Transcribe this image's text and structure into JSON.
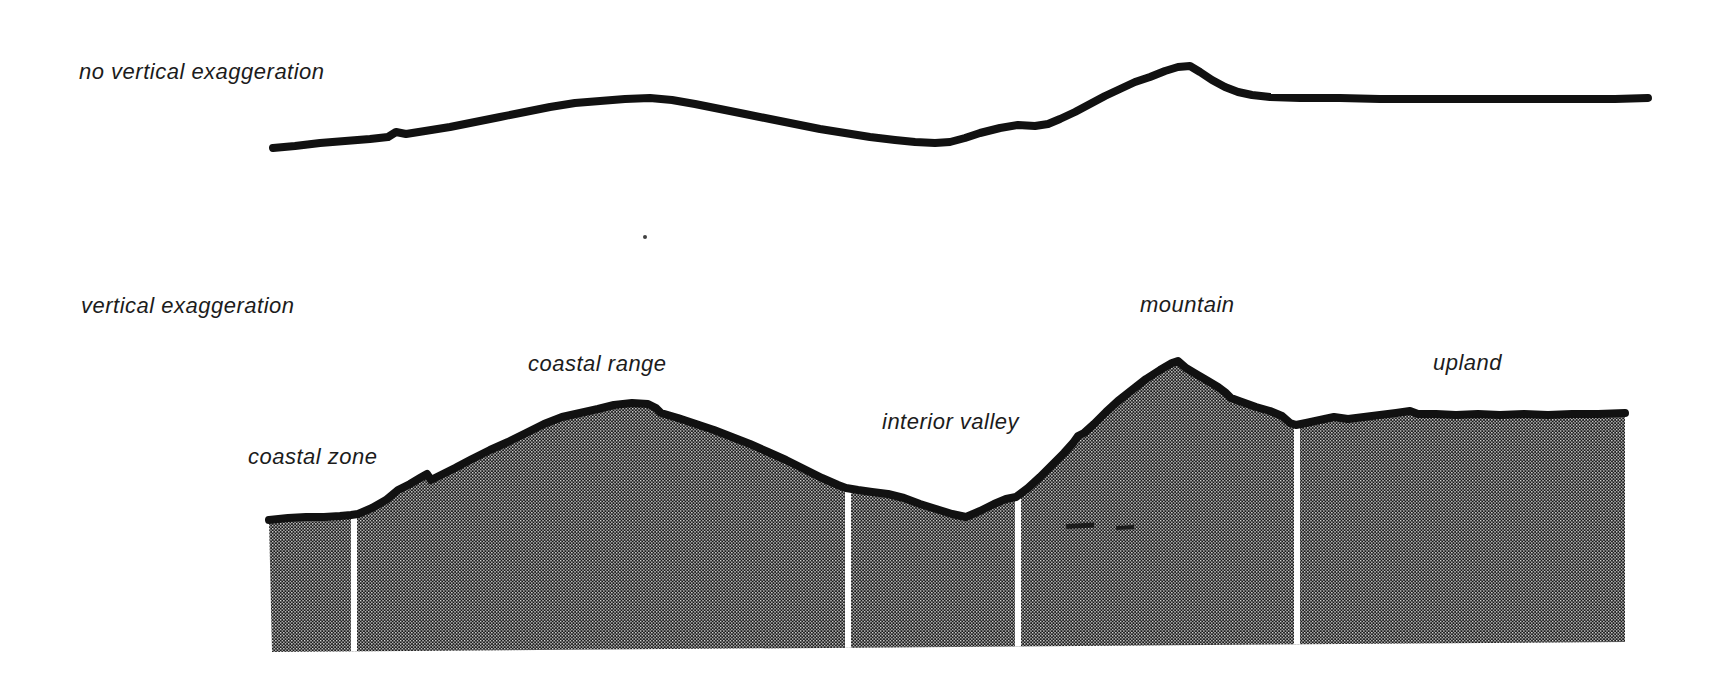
{
  "figure": {
    "width": 1717,
    "height": 695,
    "background": "#ffffff"
  },
  "labels": {
    "top_profile": {
      "text": "no vertical exaggeration",
      "x": 79,
      "y": 60
    },
    "bottom_profile": {
      "text": "vertical exaggeration",
      "x": 81,
      "y": 294
    },
    "zones": [
      {
        "text": "coastal zone",
        "x": 248,
        "y": 445
      },
      {
        "text": "coastal range",
        "x": 528,
        "y": 352
      },
      {
        "text": "interior valley",
        "x": 882,
        "y": 410
      },
      {
        "text": "mountain",
        "x": 1140,
        "y": 293
      },
      {
        "text": "upland",
        "x": 1433,
        "y": 351
      }
    ]
  },
  "style": {
    "ink": "#111111",
    "halftone_background": "#1a1a1a",
    "halftone_dot": "#e8e8e8",
    "divider_color": "#ffffff",
    "profile_line_width": 8,
    "surface_line_width": 8
  },
  "geometry": {
    "top_profile_points": [
      [
        273,
        148
      ],
      [
        295,
        146
      ],
      [
        320,
        143
      ],
      [
        345,
        141
      ],
      [
        370,
        139
      ],
      [
        388,
        137
      ],
      [
        396,
        132
      ],
      [
        406,
        134
      ],
      [
        425,
        131
      ],
      [
        450,
        127
      ],
      [
        475,
        122
      ],
      [
        500,
        117
      ],
      [
        525,
        112
      ],
      [
        550,
        107
      ],
      [
        575,
        103
      ],
      [
        600,
        101
      ],
      [
        625,
        99
      ],
      [
        650,
        98
      ],
      [
        672,
        100
      ],
      [
        695,
        104
      ],
      [
        720,
        109
      ],
      [
        745,
        114
      ],
      [
        770,
        119
      ],
      [
        795,
        124
      ],
      [
        820,
        129
      ],
      [
        845,
        133
      ],
      [
        870,
        137
      ],
      [
        895,
        140
      ],
      [
        915,
        142
      ],
      [
        935,
        143
      ],
      [
        950,
        142
      ],
      [
        965,
        138
      ],
      [
        980,
        133
      ],
      [
        1000,
        128
      ],
      [
        1018,
        125
      ],
      [
        1035,
        126
      ],
      [
        1048,
        124
      ],
      [
        1060,
        119
      ],
      [
        1075,
        112
      ],
      [
        1090,
        104
      ],
      [
        1105,
        96
      ],
      [
        1120,
        89
      ],
      [
        1135,
        82
      ],
      [
        1150,
        77
      ],
      [
        1165,
        71
      ],
      [
        1178,
        67
      ],
      [
        1190,
        66
      ],
      [
        1200,
        72
      ],
      [
        1212,
        80
      ],
      [
        1225,
        87
      ],
      [
        1238,
        92
      ],
      [
        1252,
        95
      ],
      [
        1270,
        97
      ],
      [
        1300,
        98
      ],
      [
        1340,
        98
      ],
      [
        1380,
        99
      ],
      [
        1420,
        99
      ],
      [
        1460,
        99
      ],
      [
        1500,
        99
      ],
      [
        1540,
        99
      ],
      [
        1580,
        99
      ],
      [
        1615,
        99
      ],
      [
        1648,
        98
      ]
    ],
    "terrain_surface_points": [
      [
        269,
        520
      ],
      [
        288,
        518
      ],
      [
        306,
        517
      ],
      [
        324,
        517
      ],
      [
        340,
        516
      ],
      [
        351,
        515
      ],
      [
        358,
        514
      ],
      [
        372,
        508
      ],
      [
        386,
        500
      ],
      [
        398,
        490
      ],
      [
        410,
        484
      ],
      [
        420,
        478
      ],
      [
        427,
        474
      ],
      [
        431,
        480
      ],
      [
        439,
        476
      ],
      [
        455,
        468
      ],
      [
        472,
        459
      ],
      [
        490,
        450
      ],
      [
        508,
        442
      ],
      [
        526,
        433
      ],
      [
        544,
        424
      ],
      [
        562,
        417
      ],
      [
        580,
        413
      ],
      [
        598,
        409
      ],
      [
        614,
        405
      ],
      [
        632,
        403
      ],
      [
        648,
        404
      ],
      [
        656,
        408
      ],
      [
        661,
        413
      ],
      [
        678,
        418
      ],
      [
        696,
        424
      ],
      [
        714,
        430
      ],
      [
        732,
        437
      ],
      [
        750,
        444
      ],
      [
        768,
        452
      ],
      [
        786,
        460
      ],
      [
        804,
        469
      ],
      [
        822,
        478
      ],
      [
        838,
        485
      ],
      [
        846,
        488
      ],
      [
        858,
        490
      ],
      [
        872,
        492
      ],
      [
        888,
        494
      ],
      [
        904,
        498
      ],
      [
        920,
        504
      ],
      [
        936,
        509
      ],
      [
        952,
        514
      ],
      [
        966,
        517
      ],
      [
        980,
        511
      ],
      [
        994,
        504
      ],
      [
        1006,
        499
      ],
      [
        1016,
        497
      ],
      [
        1028,
        488
      ],
      [
        1040,
        477
      ],
      [
        1052,
        465
      ],
      [
        1064,
        453
      ],
      [
        1073,
        443
      ],
      [
        1078,
        436
      ],
      [
        1084,
        433
      ],
      [
        1094,
        424
      ],
      [
        1106,
        412
      ],
      [
        1118,
        401
      ],
      [
        1132,
        390
      ],
      [
        1146,
        379
      ],
      [
        1160,
        370
      ],
      [
        1172,
        363
      ],
      [
        1178,
        361
      ],
      [
        1186,
        368
      ],
      [
        1196,
        374
      ],
      [
        1208,
        381
      ],
      [
        1218,
        387
      ],
      [
        1226,
        393
      ],
      [
        1231,
        398
      ],
      [
        1242,
        402
      ],
      [
        1256,
        407
      ],
      [
        1270,
        411
      ],
      [
        1282,
        416
      ],
      [
        1290,
        423
      ],
      [
        1296,
        425
      ],
      [
        1306,
        423
      ],
      [
        1320,
        420
      ],
      [
        1334,
        417
      ],
      [
        1348,
        419
      ],
      [
        1364,
        417
      ],
      [
        1380,
        415
      ],
      [
        1396,
        413
      ],
      [
        1410,
        411
      ],
      [
        1418,
        414
      ],
      [
        1436,
        414
      ],
      [
        1456,
        415
      ],
      [
        1478,
        414
      ],
      [
        1500,
        415
      ],
      [
        1524,
        414
      ],
      [
        1548,
        415
      ],
      [
        1572,
        414
      ],
      [
        1598,
        414
      ],
      [
        1625,
        413
      ]
    ],
    "terrain_base_points": [
      [
        1625,
        642
      ],
      [
        272,
        652
      ]
    ],
    "dividers": [
      {
        "x": 351,
        "width": 6,
        "y_top": 510
      },
      {
        "x": 845,
        "width": 6,
        "y_top": 484
      },
      {
        "x": 1015,
        "width": 6,
        "y_top": 493
      },
      {
        "x": 1294,
        "width": 6,
        "y_top": 420
      }
    ],
    "smudge_marks": [
      {
        "x": 1066,
        "y": 524,
        "width": 28,
        "height": 5
      },
      {
        "x": 1116,
        "y": 526,
        "width": 18,
        "height": 4
      }
    ],
    "specks": [
      {
        "x": 645,
        "y": 237,
        "r": 2
      }
    ]
  }
}
